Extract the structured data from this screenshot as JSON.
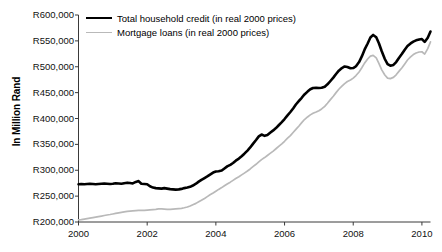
{
  "chart_data": {
    "type": "line",
    "title": "",
    "xlabel": "",
    "ylabel": "In Million Rand",
    "xlim": [
      2000,
      2010.25
    ],
    "ylim": [
      200000,
      600000
    ],
    "grid": false,
    "legend_position": "top-left",
    "y_ticks": [
      200000,
      250000,
      300000,
      350000,
      400000,
      450000,
      500000,
      550000,
      600000
    ],
    "y_tick_labels": [
      "R200,000",
      "R250,000",
      "R300,000",
      "R350,000",
      "R400,000",
      "R450,000",
      "R500,000",
      "R550,000",
      "R600,000"
    ],
    "x_ticks": [
      2000,
      2002,
      2004,
      2006,
      2008,
      2010
    ],
    "x_tick_labels": [
      "2000",
      "2002",
      "2004",
      "2006",
      "2008",
      "2010"
    ],
    "series": [
      {
        "name": "Total household credit (in real 2000 prices)",
        "color": "#000000",
        "width": 2.6,
        "x": [
          2000.0,
          2000.08,
          2000.17,
          2000.25,
          2000.33,
          2000.42,
          2000.5,
          2000.58,
          2000.67,
          2000.75,
          2000.83,
          2000.92,
          2001.0,
          2001.08,
          2001.17,
          2001.25,
          2001.33,
          2001.42,
          2001.5,
          2001.58,
          2001.67,
          2001.75,
          2001.83,
          2001.92,
          2002.0,
          2002.08,
          2002.17,
          2002.25,
          2002.33,
          2002.42,
          2002.5,
          2002.58,
          2002.67,
          2002.75,
          2002.83,
          2002.92,
          2003.0,
          2003.08,
          2003.17,
          2003.25,
          2003.33,
          2003.42,
          2003.5,
          2003.58,
          2003.67,
          2003.75,
          2003.83,
          2003.92,
          2004.0,
          2004.08,
          2004.17,
          2004.25,
          2004.33,
          2004.42,
          2004.5,
          2004.58,
          2004.67,
          2004.75,
          2004.83,
          2004.92,
          2005.0,
          2005.08,
          2005.17,
          2005.25,
          2005.33,
          2005.42,
          2005.5,
          2005.58,
          2005.67,
          2005.75,
          2005.83,
          2005.92,
          2006.0,
          2006.08,
          2006.17,
          2006.25,
          2006.33,
          2006.42,
          2006.5,
          2006.58,
          2006.67,
          2006.75,
          2006.83,
          2006.92,
          2007.0,
          2007.08,
          2007.17,
          2007.25,
          2007.33,
          2007.42,
          2007.5,
          2007.58,
          2007.67,
          2007.75,
          2007.83,
          2007.92,
          2008.0,
          2008.08,
          2008.17,
          2008.25,
          2008.33,
          2008.42,
          2008.5,
          2008.58,
          2008.67,
          2008.75,
          2008.83,
          2008.92,
          2009.0,
          2009.08,
          2009.17,
          2009.25,
          2009.33,
          2009.42,
          2009.5,
          2009.58,
          2009.67,
          2009.75,
          2009.83,
          2009.92,
          2010.0,
          2010.08,
          2010.17,
          2010.25
        ],
        "values": [
          273000,
          273500,
          273000,
          273500,
          274000,
          273500,
          273000,
          273500,
          274000,
          274500,
          274000,
          273500,
          274000,
          275000,
          274500,
          274000,
          275000,
          276000,
          275500,
          274500,
          277500,
          279000,
          274000,
          273500,
          273000,
          269000,
          266500,
          265500,
          265000,
          264500,
          265500,
          264500,
          263500,
          263000,
          262500,
          263000,
          264000,
          265500,
          266500,
          268000,
          270500,
          274000,
          278000,
          281500,
          285000,
          288000,
          291500,
          295500,
          297500,
          298000,
          299500,
          303500,
          307500,
          310500,
          314000,
          318500,
          322500,
          327000,
          332000,
          338000,
          344000,
          351000,
          358500,
          365500,
          369000,
          366500,
          368000,
          372500,
          377000,
          381500,
          387000,
          393000,
          399000,
          405500,
          412500,
          419500,
          427000,
          434000,
          440000,
          446500,
          452000,
          456500,
          459000,
          459500,
          459000,
          459500,
          461500,
          466000,
          472000,
          479000,
          486000,
          492500,
          497500,
          500500,
          499500,
          497000,
          497500,
          501000,
          509000,
          520000,
          533000,
          545000,
          556500,
          561500,
          557000,
          545000,
          530000,
          515000,
          505000,
          502000,
          503500,
          509000,
          517000,
          525000,
          533000,
          540000,
          545000,
          548500,
          551000,
          552500,
          553500,
          548000,
          556000,
          568000
        ]
      },
      {
        "name": "Mortgage loans (in real 2000 prices)",
        "color": "#b9b9b9",
        "width": 1.7,
        "x": [
          2000.0,
          2000.08,
          2000.17,
          2000.25,
          2000.33,
          2000.42,
          2000.5,
          2000.58,
          2000.67,
          2000.75,
          2000.83,
          2000.92,
          2001.0,
          2001.08,
          2001.17,
          2001.25,
          2001.33,
          2001.42,
          2001.5,
          2001.58,
          2001.67,
          2001.75,
          2001.83,
          2001.92,
          2002.0,
          2002.08,
          2002.17,
          2002.25,
          2002.33,
          2002.42,
          2002.5,
          2002.58,
          2002.67,
          2002.75,
          2002.83,
          2002.92,
          2003.0,
          2003.08,
          2003.17,
          2003.25,
          2003.33,
          2003.42,
          2003.5,
          2003.58,
          2003.67,
          2003.75,
          2003.83,
          2003.92,
          2004.0,
          2004.08,
          2004.17,
          2004.25,
          2004.33,
          2004.42,
          2004.5,
          2004.58,
          2004.67,
          2004.75,
          2004.83,
          2004.92,
          2005.0,
          2005.08,
          2005.17,
          2005.25,
          2005.33,
          2005.42,
          2005.5,
          2005.58,
          2005.67,
          2005.75,
          2005.83,
          2005.92,
          2006.0,
          2006.08,
          2006.17,
          2006.25,
          2006.33,
          2006.42,
          2006.5,
          2006.58,
          2006.67,
          2006.75,
          2006.83,
          2006.92,
          2007.0,
          2007.08,
          2007.17,
          2007.25,
          2007.33,
          2007.42,
          2007.5,
          2007.58,
          2007.67,
          2007.75,
          2007.83,
          2007.92,
          2008.0,
          2008.08,
          2008.17,
          2008.25,
          2008.33,
          2008.42,
          2008.5,
          2008.58,
          2008.67,
          2008.75,
          2008.83,
          2008.92,
          2009.0,
          2009.08,
          2009.17,
          2009.25,
          2009.33,
          2009.42,
          2009.5,
          2009.58,
          2009.67,
          2009.75,
          2009.83,
          2009.92,
          2010.0,
          2010.08,
          2010.17,
          2010.25
        ],
        "values": [
          204000,
          204500,
          205500,
          206500,
          207500,
          208500,
          209500,
          210500,
          211500,
          212500,
          213500,
          214500,
          215500,
          216500,
          217500,
          218500,
          219500,
          220500,
          221000,
          221500,
          222000,
          222500,
          222500,
          222500,
          223000,
          223500,
          224000,
          224500,
          225500,
          225500,
          225000,
          224500,
          224500,
          225000,
          225500,
          226000,
          226500,
          227500,
          229000,
          231000,
          233500,
          236000,
          239000,
          242000,
          245500,
          249000,
          252500,
          256000,
          259500,
          263000,
          266500,
          270000,
          273500,
          277000,
          280500,
          284000,
          287500,
          291000,
          294500,
          298500,
          302500,
          307000,
          311500,
          316000,
          320500,
          324500,
          328500,
          332500,
          337000,
          341500,
          346000,
          351000,
          356000,
          361500,
          367000,
          373000,
          379000,
          385500,
          392000,
          398000,
          403000,
          407000,
          410000,
          412500,
          415000,
          418500,
          423500,
          429500,
          436000,
          443000,
          450000,
          456500,
          462500,
          467500,
          471500,
          474500,
          478000,
          483000,
          490000,
          498000,
          507000,
          515000,
          520500,
          522000,
          517000,
          506000,
          494000,
          484000,
          478000,
          477000,
          479500,
          484500,
          491000,
          498000,
          505500,
          513000,
          519000,
          523500,
          526500,
          528500,
          529000,
          524500,
          535000,
          548000
        ]
      }
    ]
  },
  "axes": {
    "y_title": "In Million Rand"
  },
  "legend": {
    "items": [
      {
        "label": "Total household credit (in real 2000 prices)",
        "color": "#000000",
        "style": "black"
      },
      {
        "label": "Mortgage loans (in real 2000 prices)",
        "color": "#b9b9b9",
        "style": "gray"
      }
    ]
  }
}
